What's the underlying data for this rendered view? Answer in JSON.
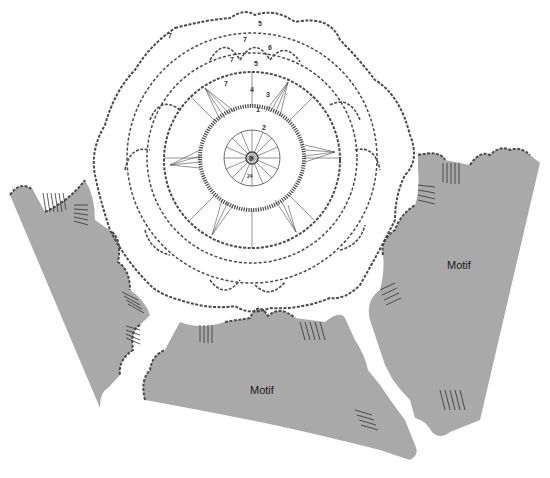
{
  "diagram": {
    "type": "crochet-chart",
    "background": "#ffffff",
    "motif_fill": "#a9a9a9",
    "stitch_color": "#4a4a4a",
    "center_motif": {
      "shape": "hexagonal doily",
      "center": [
        250,
        158
      ],
      "center_ring_label": "0",
      "row_labels": [
        "1",
        "2",
        "3",
        "4",
        "5",
        "6",
        "7",
        "7",
        "7",
        "7",
        "5",
        "24"
      ]
    },
    "motifs": [
      {
        "id": "left",
        "label": ""
      },
      {
        "id": "right",
        "label": "Motif"
      },
      {
        "id": "bottom",
        "label": "Motif"
      }
    ]
  }
}
